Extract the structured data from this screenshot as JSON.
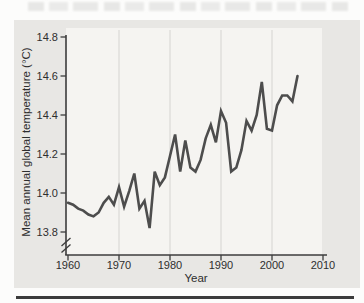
{
  "figure": {
    "xlabel": "Year",
    "ylabel": "Mean annual global temperature (°C)"
  },
  "chart_data": {
    "type": "line",
    "title": "",
    "xlabel": "Year",
    "ylabel": "Mean annual global temperature (°C)",
    "x": [
      1960,
      1961,
      1962,
      1963,
      1964,
      1965,
      1966,
      1967,
      1968,
      1969,
      1970,
      1971,
      1972,
      1973,
      1974,
      1975,
      1976,
      1977,
      1978,
      1979,
      1980,
      1981,
      1982,
      1983,
      1984,
      1985,
      1986,
      1987,
      1988,
      1989,
      1990,
      1991,
      1992,
      1993,
      1994,
      1995,
      1996,
      1997,
      1998,
      1999,
      2000,
      2001,
      2002,
      2003,
      2004,
      2005
    ],
    "values": [
      13.95,
      13.94,
      13.92,
      13.91,
      13.89,
      13.88,
      13.9,
      13.95,
      13.98,
      13.94,
      14.03,
      13.93,
      14.01,
      14.1,
      13.92,
      13.96,
      13.82,
      14.11,
      14.04,
      14.08,
      14.19,
      14.3,
      14.11,
      14.27,
      14.13,
      14.11,
      14.17,
      14.28,
      14.35,
      14.26,
      14.42,
      14.36,
      14.11,
      14.13,
      14.22,
      14.37,
      14.32,
      14.4,
      14.57,
      14.33,
      14.32,
      14.45,
      14.5,
      14.5,
      14.47,
      14.6
    ],
    "xlim": [
      1960,
      2010
    ],
    "ylim": [
      13.8,
      14.8
    ],
    "x_ticks": [
      1960,
      1970,
      1980,
      1990,
      2000,
      2010
    ],
    "x_tick_labels": [
      "1960",
      "1970",
      "1980",
      "1990",
      "2000",
      "2010"
    ],
    "y_ticks": [
      13.8,
      14.0,
      14.2,
      14.4,
      14.6,
      14.8
    ],
    "y_tick_labels": [
      "13.8",
      "14.0",
      "14.2",
      "14.4",
      "14.6",
      "14.8"
    ],
    "gridline_years": [
      1970,
      1980,
      1990,
      2000
    ],
    "grid": "vertical-only",
    "legend": "none",
    "y_axis_break_below_min": true,
    "line_color": "#4d4d4d",
    "axis_color": "#3c3c3c",
    "gridline_color": "#d5d4d1",
    "plot_bg_color": "#f5f4f1",
    "card_bg_color": "#e8e7e4"
  }
}
